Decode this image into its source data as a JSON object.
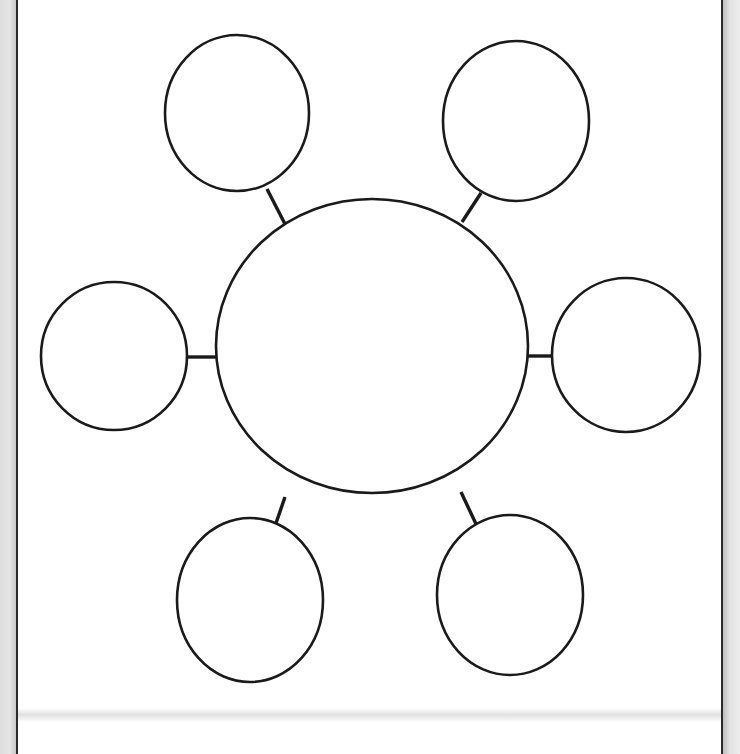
{
  "diagram": {
    "type": "bubble-map",
    "stroke_color": "#1a1a1a",
    "background_color": "#ffffff",
    "center_node": {
      "label": "",
      "cx": 372,
      "cy": 346,
      "rx": 156,
      "ry": 147
    },
    "satellite_nodes": [
      {
        "id": "top-left",
        "label": "",
        "cx": 237,
        "cy": 113,
        "rx": 72,
        "ry": 78,
        "connector": {
          "x1": 267,
          "y1": 189,
          "x2": 285,
          "y2": 224
        }
      },
      {
        "id": "top-right",
        "label": "",
        "cx": 516,
        "cy": 121,
        "rx": 73,
        "ry": 80,
        "connector": {
          "x1": 481,
          "y1": 193,
          "x2": 462,
          "y2": 222
        }
      },
      {
        "id": "left",
        "label": "",
        "cx": 114,
        "cy": 356,
        "rx": 73,
        "ry": 74,
        "connector": {
          "x1": 186,
          "y1": 357,
          "x2": 216,
          "y2": 357
        }
      },
      {
        "id": "right",
        "label": "",
        "cx": 626,
        "cy": 355,
        "rx": 74,
        "ry": 77,
        "connector": {
          "x1": 528,
          "y1": 356,
          "x2": 553,
          "y2": 356
        }
      },
      {
        "id": "bottom-left",
        "label": "",
        "cx": 250,
        "cy": 600,
        "rx": 73,
        "ry": 82,
        "connector": {
          "x1": 285,
          "y1": 497,
          "x2": 274,
          "y2": 529
        }
      },
      {
        "id": "bottom-right",
        "label": "",
        "cx": 510,
        "cy": 595,
        "rx": 73,
        "ry": 80,
        "connector": {
          "x1": 461,
          "y1": 492,
          "x2": 476,
          "y2": 524
        }
      }
    ]
  }
}
